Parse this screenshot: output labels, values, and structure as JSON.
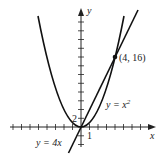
{
  "figure": {
    "axes": {
      "x_label": "x",
      "y_label": "y"
    },
    "ticks": {
      "x_tick_label": "1",
      "y_tick_label": "2"
    },
    "curves": [
      {
        "name": "parabola",
        "label_prefix": "y = ",
        "label_var": "x",
        "label_sup": "2"
      },
      {
        "name": "line",
        "label": "y = 4x"
      }
    ],
    "intersection": {
      "label": "(4, 16)",
      "x": 4,
      "y": 16
    },
    "colors": {
      "curve": "#111111",
      "shade": "#dddddd",
      "axis": "#222222"
    }
  }
}
